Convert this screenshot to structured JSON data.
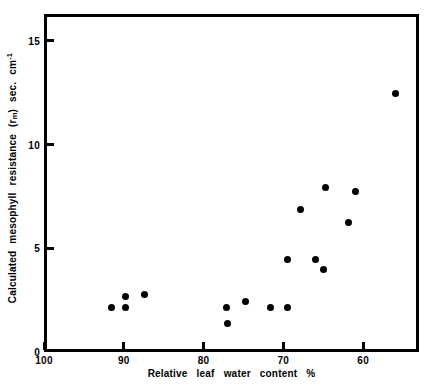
{
  "chart_data": {
    "type": "scatter",
    "title": "",
    "xlabel": "Relative  leaf  water  content %",
    "ylabel": "Calculated  mesophyll  resistance  (rₘ) sec. cm⁻¹",
    "xlabel_parts": [
      "Relative",
      "leaf",
      "water",
      "content",
      "%"
    ],
    "ylabel_parts": [
      "Calculated",
      "mesophyll",
      "resistance",
      "(r",
      "m",
      ")",
      "sec.",
      "cm",
      "-1"
    ],
    "xlim": [
      100,
      53
    ],
    "ylim": [
      0,
      16.3
    ],
    "x_axis_reversed": true,
    "xticks": [
      100,
      90,
      80,
      70,
      60
    ],
    "xticklabels": [
      "100",
      "90",
      "80",
      "70",
      "60"
    ],
    "yticks": [
      0,
      5,
      10,
      15
    ],
    "yticklabels": [
      "0",
      "5",
      "10",
      "15"
    ],
    "grid": false,
    "legend": null,
    "marker": "filled-circle",
    "marker_color": "#000000",
    "points": [
      {
        "x": 91.9,
        "y": 2.3
      },
      {
        "x": 90.1,
        "y": 2.8
      },
      {
        "x": 90.1,
        "y": 2.3
      },
      {
        "x": 87.8,
        "y": 2.9
      },
      {
        "x": 77.5,
        "y": 2.3
      },
      {
        "x": 77.4,
        "y": 1.5
      },
      {
        "x": 75.1,
        "y": 2.6
      },
      {
        "x": 69.9,
        "y": 4.6
      },
      {
        "x": 69.8,
        "y": 2.3
      },
      {
        "x": 68.2,
        "y": 7.0
      },
      {
        "x": 66.4,
        "y": 4.6
      },
      {
        "x": 65.3,
        "y": 4.1
      },
      {
        "x": 65.1,
        "y": 8.1
      },
      {
        "x": 62.2,
        "y": 6.4
      },
      {
        "x": 61.3,
        "y": 7.9
      },
      {
        "x": 56.3,
        "y": 12.6
      },
      {
        "x": 72.0,
        "y": 2.3
      }
    ]
  }
}
